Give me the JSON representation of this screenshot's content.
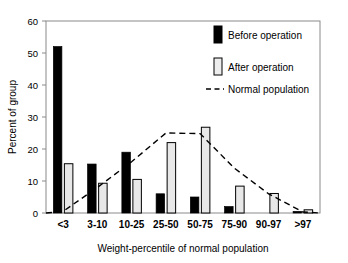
{
  "chart_data": {
    "type": "bar",
    "title": "",
    "xlabel": "Weight-percentile of normal population",
    "ylabel": "Percent of group",
    "categories": [
      "<3",
      "3-10",
      "10-25",
      "25-50",
      "50-75",
      "75-90",
      "90-97",
      ">97"
    ],
    "ylim": [
      0,
      60
    ],
    "yticks": [
      0,
      10,
      20,
      30,
      40,
      50,
      60
    ],
    "ytick_labels": [
      "0",
      "10",
      "20",
      "30",
      "40",
      "50",
      "60"
    ],
    "grid": false,
    "legend_position": "top-right",
    "series": [
      {
        "name": "Before operation",
        "style": "bar-filled",
        "color": "#000000",
        "values": [
          52,
          15.3,
          19,
          6,
          5,
          2,
          0,
          0.5
        ]
      },
      {
        "name": "After operation",
        "style": "bar-open",
        "color": "#e8e8e8",
        "edge_color": "#000000",
        "values": [
          15.4,
          9.3,
          10.5,
          22,
          26.8,
          8.4,
          6.1,
          1
        ]
      },
      {
        "name": "Normal population",
        "style": "dashed-line",
        "color": "#000000",
        "values": [
          0.5,
          8,
          16,
          25,
          24.8,
          14,
          6,
          0.3
        ]
      }
    ],
    "legend": [
      {
        "label": "Before operation",
        "marker": "filled-bar-swatch"
      },
      {
        "label": "After operation",
        "marker": "open-bar-swatch"
      },
      {
        "label": "Normal population",
        "marker": "dashed-line-swatch"
      }
    ],
    "annotations": []
  },
  "axes": {
    "y_title": "Percent of group",
    "x_title": "Weight-percentile of normal population"
  },
  "colors": {
    "before": "#000000",
    "after_fill": "#e9e9e9",
    "after_edge": "#000000",
    "normal_line": "#000000",
    "frame": "#808080",
    "background": "#ffffff"
  }
}
